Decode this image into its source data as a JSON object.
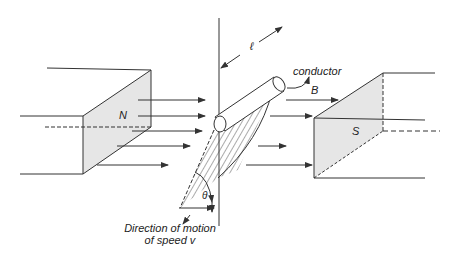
{
  "diagram": {
    "colors": {
      "line": "#333333",
      "face_fill": "#e6e6e6",
      "background": "#ffffff"
    },
    "labels": {
      "north_pole": "N",
      "south_pole": "S",
      "field": "B",
      "conductor": "conductor",
      "length": "ℓ",
      "angle": "θ",
      "motion_line1": "Direction of motion",
      "motion_line2": "of speed v"
    }
  }
}
